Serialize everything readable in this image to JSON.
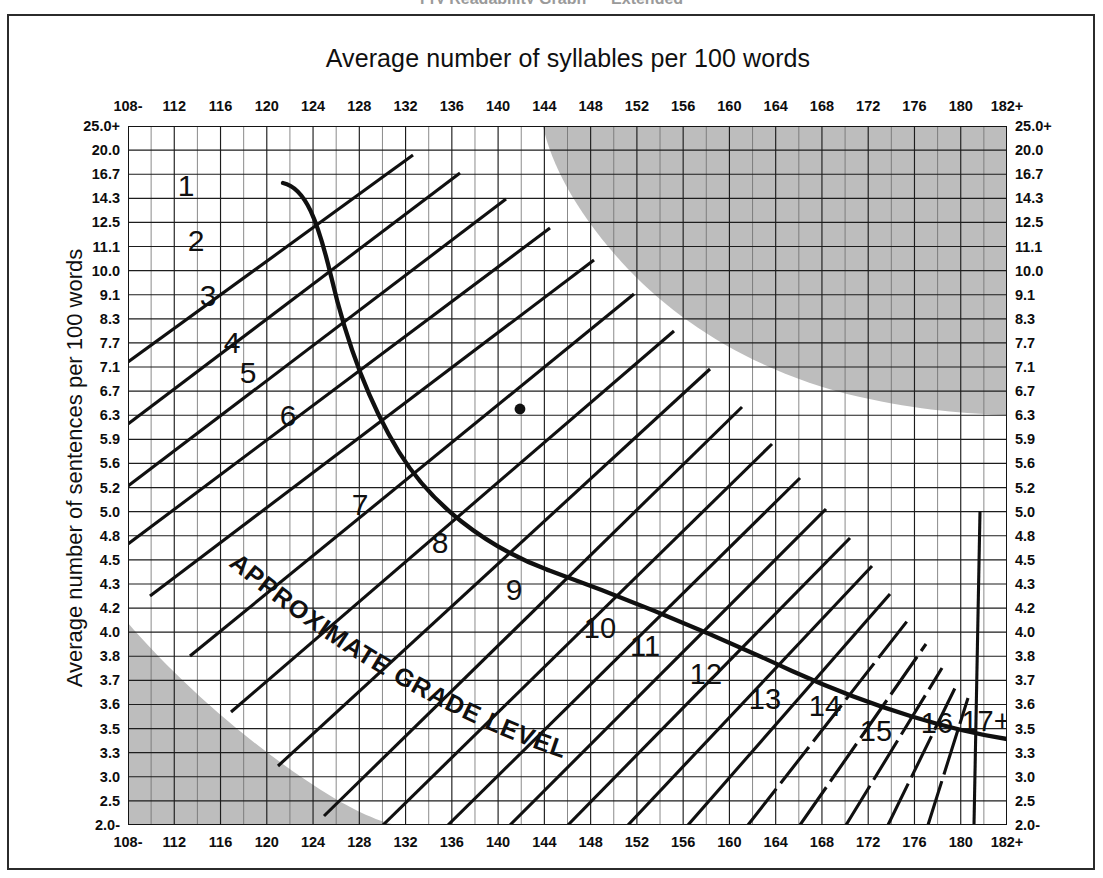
{
  "document": {
    "clipped_heading": "Fry Readability Graph — Extended"
  },
  "chart": {
    "title": "Average number of syllables per 100 words",
    "y_axis_title": "Average number of sentences per 100 words",
    "curve_label": "APPROXIMATE GRADE LEVEL"
  },
  "axes": {
    "x_ticks": [
      "108-",
      "112",
      "116",
      "120",
      "124",
      "128",
      "132",
      "136",
      "140",
      "144",
      "148",
      "152",
      "156",
      "160",
      "164",
      "168",
      "172",
      "176",
      "180",
      "182+"
    ],
    "y_ticks": [
      "25.0+",
      "20.0",
      "16.7",
      "14.3",
      "12.5",
      "11.1",
      "10.0",
      "9.1",
      "8.3",
      "7.7",
      "7.1",
      "6.7",
      "6.3",
      "5.9",
      "5.6",
      "5.2",
      "5.0",
      "4.8",
      "4.5",
      "4.3",
      "4.2",
      "4.0",
      "3.8",
      "3.7",
      "3.6",
      "3.5",
      "3.3",
      "3.0",
      "2.5",
      "2.0-"
    ]
  },
  "grade_labels": [
    "1",
    "2",
    "3",
    "4",
    "5",
    "6",
    "7",
    "8",
    "9",
    "10",
    "11",
    "12",
    "13",
    "14",
    "15",
    "16",
    "17+"
  ],
  "colors": {
    "shading": "#bdbdbd",
    "grid_minor": "#6d6d6d",
    "grid_major": "#1d1d1d",
    "ink": "#101010",
    "frame": "#2b2b2b"
  },
  "chart_data": {
    "type": "scatter",
    "title": "Fry Readability Graph",
    "xlabel": "Average number of syllables per 100 words",
    "ylabel": "Average number of sentences per 100 words",
    "xlim": [
      108,
      182
    ],
    "ylim": [
      2.0,
      25.0
    ],
    "grid": true,
    "legend": false,
    "annotations": [
      "APPROXIMATE GRADE LEVEL"
    ],
    "xtick_labels": [
      "108-",
      "112",
      "116",
      "120",
      "124",
      "128",
      "132",
      "136",
      "140",
      "144",
      "148",
      "152",
      "156",
      "160",
      "164",
      "168",
      "172",
      "176",
      "180",
      "182+"
    ],
    "ytick_labels": [
      "25.0+",
      "20.0",
      "16.7",
      "14.3",
      "12.5",
      "11.1",
      "10.0",
      "9.1",
      "8.3",
      "7.7",
      "7.1",
      "6.7",
      "6.3",
      "5.9",
      "5.6",
      "5.2",
      "5.0",
      "4.8",
      "4.5",
      "4.3",
      "4.2",
      "4.0",
      "3.8",
      "3.7",
      "3.6",
      "3.5",
      "3.3",
      "3.0",
      "2.5",
      "2.0-"
    ],
    "points": [
      {
        "label": "plotted sample",
        "syllables": 141,
        "sentences": 6.3
      }
    ],
    "series": [
      {
        "name": "grade-bands",
        "values": [
          1,
          2,
          3,
          4,
          5,
          6,
          7,
          8,
          9,
          10,
          11,
          12,
          13,
          14,
          15,
          16,
          17
        ]
      }
    ],
    "shaded_regions": [
      {
        "name": "upper-right invalid zone",
        "position": "top-right"
      },
      {
        "name": "lower-left invalid zone",
        "position": "bottom-left"
      }
    ]
  }
}
